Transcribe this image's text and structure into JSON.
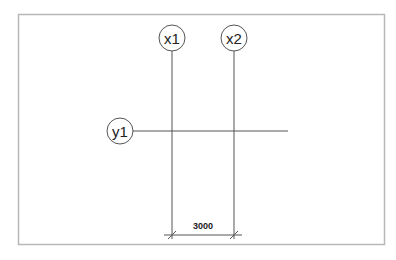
{
  "diagram": {
    "type": "structural-grid",
    "frame": {
      "x": 18,
      "y": 14,
      "width": 366,
      "height": 230,
      "color": "#b0b0b0"
    },
    "line_color": "#555555",
    "grid_lines": [
      {
        "label": "x1",
        "orientation": "vertical",
        "position": 172
      },
      {
        "label": "x2",
        "orientation": "vertical",
        "position": 234
      },
      {
        "label": "y1",
        "orientation": "horizontal",
        "position": 131
      }
    ],
    "dimension": {
      "value": "3000",
      "from": "x1",
      "to": "x2"
    }
  }
}
